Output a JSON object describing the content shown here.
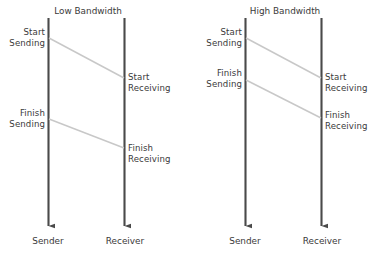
{
  "image": {
    "width": 380,
    "height": 257,
    "background": "#ffffff",
    "kind": "sequence-timing-diagram"
  },
  "style": {
    "lifeline_color": "#4a4a4a",
    "message_color": "#c8c8c8",
    "text_color": "#3a3a3a"
  },
  "diagrams": [
    {
      "id": "low-bandwidth",
      "title": "Low Bandwidth",
      "lifelines": [
        {
          "id": "sender",
          "label": "Sender",
          "x": 48.5,
          "top": 18,
          "bottom": 232
        },
        {
          "id": "receiver",
          "label": "Receiver",
          "x": 124.5,
          "top": 18,
          "bottom": 232
        }
      ],
      "events": [
        {
          "id": "start-sending",
          "label": "Start\nSending",
          "side": "left",
          "x": 45,
          "y": 27
        },
        {
          "id": "start-receiving",
          "label": "Start\nReceiving",
          "side": "right",
          "x": 128,
          "y": 72
        },
        {
          "id": "finish-sending",
          "label": "Finish\nSending",
          "side": "left",
          "x": 45,
          "y": 108
        },
        {
          "id": "finish-receiving",
          "label": "Finish\nReceiving",
          "side": "right",
          "x": 128,
          "y": 143
        }
      ],
      "messages": [
        {
          "id": "first-bit",
          "from_x": 49,
          "from_y": 38,
          "to_x": 124,
          "to_y": 78
        },
        {
          "id": "last-bit",
          "from_x": 49,
          "from_y": 119,
          "to_x": 124,
          "to_y": 148
        }
      ]
    },
    {
      "id": "high-bandwidth",
      "title": "High Bandwidth",
      "lifelines": [
        {
          "id": "sender",
          "label": "Sender",
          "x": 245.5,
          "top": 18,
          "bottom": 232
        },
        {
          "id": "receiver",
          "label": "Receiver",
          "x": 321.5,
          "top": 18,
          "bottom": 232
        }
      ],
      "events": [
        {
          "id": "start-sending",
          "label": "Start\nSending",
          "side": "left",
          "x": 242,
          "y": 27
        },
        {
          "id": "start-receiving",
          "label": "Start\nReceiving",
          "side": "right",
          "x": 325,
          "y": 72
        },
        {
          "id": "finish-sending",
          "label": "Finish\nSending",
          "side": "left",
          "x": 242,
          "y": 68
        },
        {
          "id": "finish-receiving",
          "label": "Finish\nReceiving",
          "side": "right",
          "x": 325,
          "y": 110
        }
      ],
      "messages": [
        {
          "id": "first-bit",
          "from_x": 246,
          "from_y": 38,
          "to_x": 321,
          "to_y": 78
        },
        {
          "id": "last-bit",
          "from_x": 246,
          "from_y": 80,
          "to_x": 321,
          "to_y": 118
        }
      ]
    }
  ],
  "titles": {
    "low": {
      "text": "Low Bandwidth",
      "cx": 88,
      "y": 6
    },
    "high": {
      "text": "High Bandwidth",
      "cx": 285,
      "y": 6
    }
  },
  "axis_labels": {
    "low_sender": {
      "text": "Sender",
      "cx": 48,
      "y": 236
    },
    "low_receiver": {
      "text": "Receiver",
      "cx": 125,
      "y": 236
    },
    "high_sender": {
      "text": "Sender",
      "cx": 245,
      "y": 236
    },
    "high_receiver": {
      "text": "Receiver",
      "cx": 322,
      "y": 236
    }
  }
}
